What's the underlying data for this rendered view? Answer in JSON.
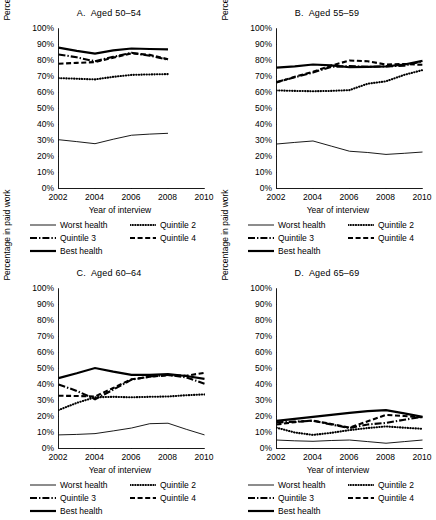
{
  "figure": {
    "axis_label_y": "Percentage in paid work",
    "axis_label_x": "Year of interview",
    "yticks": [
      "0%",
      "10%",
      "20%",
      "30%",
      "40%",
      "50%",
      "60%",
      "70%",
      "80%",
      "90%",
      "100%"
    ],
    "xticks": [
      "2002",
      "2004",
      "2006",
      "2008",
      "2010"
    ],
    "legend": [
      {
        "label": "Worst health",
        "style": "thin-solid"
      },
      {
        "label": "Quintile 2",
        "style": "dotted"
      },
      {
        "label": "Quintile 3",
        "style": "dash-dot"
      },
      {
        "label": "Quintile 4",
        "style": "dashed"
      },
      {
        "label": "Best health",
        "style": "thick-solid"
      }
    ]
  },
  "chart_data": [
    {
      "type": "line",
      "panel": "A",
      "title": "Aged 50–54",
      "xlabel": "Year of interview",
      "ylabel": "Percentage in paid work",
      "xlim": [
        2002,
        2010
      ],
      "ylim": [
        0,
        100
      ],
      "ytick_step": 10,
      "grid": false,
      "legend_position": "below",
      "x": [
        2002,
        2003,
        2004,
        2005,
        2006,
        2007,
        2008
      ],
      "series": [
        {
          "name": "Worst health",
          "style": "thin-solid",
          "values": [
            30.5,
            29.3,
            28.0,
            30.8,
            33.3,
            34.0,
            34.5
          ]
        },
        {
          "name": "Quintile 2",
          "style": "dotted",
          "values": [
            69.0,
            68.6,
            68.2,
            69.8,
            71.0,
            71.3,
            71.5
          ]
        },
        {
          "name": "Quintile 3",
          "style": "dash-dot",
          "values": [
            83.8,
            82.0,
            79.5,
            82.3,
            84.8,
            83.0,
            80.5
          ]
        },
        {
          "name": "Quintile 4",
          "style": "dashed",
          "values": [
            78.0,
            78.5,
            79.0,
            81.8,
            84.5,
            83.5,
            80.8
          ]
        },
        {
          "name": "Best health",
          "style": "thick-solid",
          "values": [
            88.0,
            86.0,
            84.3,
            86.3,
            87.5,
            87.2,
            87.0
          ]
        }
      ]
    },
    {
      "type": "line",
      "panel": "B",
      "title": "Aged 55–59",
      "xlabel": "Year of interview",
      "ylabel": "Percentage in paid work",
      "xlim": [
        2002,
        2010
      ],
      "ylim": [
        0,
        100
      ],
      "ytick_step": 10,
      "grid": false,
      "legend_position": "below",
      "x": [
        2002,
        2003,
        2004,
        2005,
        2006,
        2007,
        2008,
        2009,
        2010
      ],
      "series": [
        {
          "name": "Worst health",
          "style": "thin-solid",
          "values": [
            27.8,
            28.8,
            29.7,
            26.5,
            23.3,
            22.5,
            21.3,
            22.0,
            22.8
          ]
        },
        {
          "name": "Quintile 2",
          "style": "dotted",
          "values": [
            61.3,
            61.0,
            60.8,
            61.0,
            61.5,
            65.5,
            67.0,
            71.0,
            74.0
          ]
        },
        {
          "name": "Quintile 3",
          "style": "dash-dot",
          "values": [
            66.5,
            69.5,
            72.5,
            76.0,
            76.5,
            76.0,
            76.3,
            76.8,
            79.5
          ]
        },
        {
          "name": "Quintile 4",
          "style": "dashed",
          "values": [
            66.3,
            69.8,
            73.0,
            76.8,
            80.0,
            79.5,
            77.5,
            77.8,
            77.3
          ]
        },
        {
          "name": "Best health",
          "style": "thick-solid",
          "values": [
            75.5,
            76.3,
            77.5,
            77.0,
            75.8,
            76.0,
            76.3,
            77.5,
            79.8
          ]
        }
      ]
    },
    {
      "type": "line",
      "panel": "C",
      "title": "Aged 60–64",
      "xlabel": "Year of interview",
      "ylabel": "Percentage in paid work",
      "xlim": [
        2002,
        2010
      ],
      "ylim": [
        0,
        100
      ],
      "ytick_step": 10,
      "grid": false,
      "legend_position": "below",
      "x": [
        2002,
        2003,
        2004,
        2005,
        2006,
        2007,
        2008,
        2009,
        2010
      ],
      "series": [
        {
          "name": "Worst health",
          "style": "thin-solid",
          "values": [
            8.5,
            8.8,
            9.3,
            11.0,
            12.8,
            15.5,
            15.8,
            12.0,
            8.5
          ]
        },
        {
          "name": "Quintile 2",
          "style": "dotted",
          "values": [
            24.0,
            28.5,
            32.0,
            32.3,
            32.0,
            32.3,
            32.5,
            33.3,
            33.8
          ]
        },
        {
          "name": "Quintile 3",
          "style": "dash-dot",
          "values": [
            40.0,
            36.0,
            30.8,
            36.8,
            43.0,
            45.0,
            46.0,
            44.5,
            40.5
          ]
        },
        {
          "name": "Quintile 4",
          "style": "dashed",
          "values": [
            33.0,
            32.8,
            32.5,
            37.8,
            43.3,
            44.8,
            45.8,
            45.5,
            47.3
          ]
        },
        {
          "name": "Best health",
          "style": "thick-solid",
          "values": [
            44.0,
            47.0,
            50.3,
            48.0,
            46.0,
            46.0,
            46.5,
            45.3,
            43.5
          ]
        }
      ]
    },
    {
      "type": "line",
      "panel": "D",
      "title": "Aged 65–69",
      "xlabel": "Year of interview",
      "ylabel": "Percentage in paid work",
      "xlim": [
        2002,
        2010
      ],
      "ylim": [
        0,
        100
      ],
      "ytick_step": 10,
      "grid": false,
      "legend_position": "below",
      "x": [
        2002,
        2003,
        2004,
        2005,
        2006,
        2007,
        2008,
        2009,
        2010
      ],
      "series": [
        {
          "name": "Worst health",
          "style": "thin-solid",
          "values": [
            5.3,
            4.8,
            4.5,
            5.0,
            5.3,
            4.3,
            3.3,
            4.3,
            5.3
          ]
        },
        {
          "name": "Quintile 2",
          "style": "dotted",
          "values": [
            13.0,
            10.0,
            8.5,
            9.8,
            11.5,
            12.8,
            13.8,
            13.0,
            12.3
          ]
        },
        {
          "name": "Quintile 3",
          "style": "dash-dot",
          "values": [
            16.3,
            16.8,
            17.3,
            15.0,
            12.8,
            15.0,
            16.0,
            18.0,
            19.8
          ]
        },
        {
          "name": "Quintile 4",
          "style": "dashed",
          "values": [
            15.0,
            16.5,
            17.5,
            15.3,
            13.0,
            17.0,
            21.0,
            20.3,
            19.5
          ]
        },
        {
          "name": "Best health",
          "style": "thick-solid",
          "values": [
            17.3,
            18.5,
            19.8,
            21.0,
            22.3,
            23.3,
            24.0,
            22.0,
            19.8
          ]
        }
      ]
    }
  ]
}
